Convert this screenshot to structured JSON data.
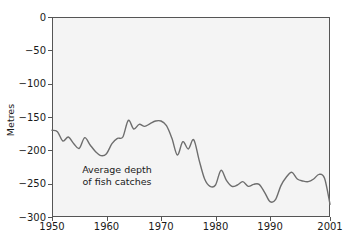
{
  "figure": {
    "background_color": "#ffffff",
    "plot_background_color": "#f4f4f4",
    "line_color": "#6e6e6e",
    "axis_color": "#555555",
    "text_color": "#1a1a1a"
  },
  "annotation": {
    "line1": "Average depth",
    "line2": "of fish catches"
  },
  "axes": {
    "y_title": "Metres",
    "x_tick_labels": [
      "1950",
      "1960",
      "1970",
      "1980",
      "1990",
      "2001"
    ],
    "y_tick_labels": [
      "0",
      "−50",
      "−100",
      "−150",
      "−200",
      "−250",
      "−300"
    ]
  },
  "chart_data": {
    "type": "line",
    "title": "",
    "subtitle": "",
    "xlabel": "",
    "ylabel": "Metres",
    "xlim": [
      1950,
      2001
    ],
    "ylim": [
      -300,
      0
    ],
    "grid": false,
    "legend": null,
    "annotations": [
      {
        "text": "Average depth of fish catches",
        "x": 1957,
        "y": -248
      }
    ],
    "x_ticks": [
      1950,
      1960,
      1970,
      1980,
      1990,
      2001
    ],
    "y_ticks": [
      0,
      -50,
      -100,
      -150,
      -200,
      -250,
      -300
    ],
    "series": [
      {
        "name": "Average depth of fish catches",
        "color": "#6e6e6e",
        "x": [
          1950,
          1951,
          1952,
          1953,
          1954,
          1955,
          1956,
          1957,
          1958,
          1959,
          1960,
          1961,
          1962,
          1963,
          1964,
          1965,
          1966,
          1967,
          1968,
          1969,
          1970,
          1971,
          1972,
          1973,
          1974,
          1975,
          1976,
          1977,
          1978,
          1979,
          1980,
          1981,
          1982,
          1983,
          1984,
          1985,
          1986,
          1987,
          1988,
          1989,
          1990,
          1991,
          1992,
          1993,
          1994,
          1995,
          1996,
          1997,
          1998,
          1999,
          2000,
          2001
        ],
        "y": [
          -170,
          -172,
          -186,
          -180,
          -190,
          -197,
          -181,
          -192,
          -202,
          -208,
          -205,
          -190,
          -182,
          -180,
          -155,
          -168,
          -161,
          -164,
          -160,
          -156,
          -156,
          -163,
          -182,
          -207,
          -187,
          -198,
          -184,
          -215,
          -243,
          -254,
          -252,
          -230,
          -245,
          -254,
          -252,
          -247,
          -254,
          -251,
          -251,
          -263,
          -277,
          -274,
          -253,
          -240,
          -233,
          -243,
          -246,
          -247,
          -243,
          -236,
          -242,
          -281
        ]
      }
    ]
  }
}
